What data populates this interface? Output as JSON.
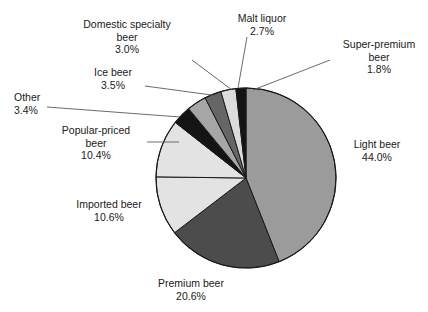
{
  "chart_data": {
    "type": "pie",
    "title": "",
    "subtitle": "",
    "xlabel": "",
    "ylabel": "",
    "legend": "none",
    "grid": false,
    "value_unit": "percent",
    "start_angle_deg": 0,
    "direction": "clockwise",
    "categories": [
      "Light beer",
      "Premium beer",
      "Imported beer",
      "Popular-priced beer",
      "Other",
      "Ice beer",
      "Domestic specialty beer",
      "Malt liquor",
      "Super-premium beer"
    ],
    "values": [
      44.0,
      20.6,
      10.6,
      10.4,
      3.4,
      3.5,
      3.0,
      2.7,
      1.8
    ],
    "slices": [
      {
        "label": "Light beer",
        "value": 44.0,
        "value_text": "44.0%",
        "color": "#9b9b9b"
      },
      {
        "label": "Premium beer",
        "value": 20.6,
        "value_text": "20.6%",
        "color": "#4c4c4c"
      },
      {
        "label": "Imported beer",
        "value": 10.6,
        "value_text": "10.6%",
        "color": "#e3e3e3"
      },
      {
        "label": "Popular-priced beer",
        "value": 10.4,
        "value_text": "10.4%",
        "color": "#e3e3e3"
      },
      {
        "label": "Other",
        "value": 3.4,
        "value_text": "3.4%",
        "color": "#141414"
      },
      {
        "label": "Ice beer",
        "value": 3.5,
        "value_text": "3.5%",
        "color": "#a6a6a6"
      },
      {
        "label": "Domestic specialty beer",
        "value": 3.0,
        "value_text": "3.0%",
        "color": "#666666"
      },
      {
        "label": "Malt liquor",
        "value": 2.7,
        "value_text": "2.7%",
        "color": "#dcdcdc"
      },
      {
        "label": "Super-premium beer",
        "value": 1.8,
        "value_text": "1.8%",
        "color": "#141414"
      }
    ]
  },
  "labels": {
    "light_beer": {
      "line1": "Light beer",
      "line2": "44.0%"
    },
    "premium_beer": {
      "line1": "Premium beer",
      "line2": "20.6%"
    },
    "imported_beer": {
      "line1": "Imported beer",
      "line2": "10.6%"
    },
    "popular_priced": {
      "line1": "Popular-priced",
      "line2": "beer",
      "line3": "10.4%"
    },
    "other": {
      "line1": "Other",
      "line2": "3.4%"
    },
    "ice_beer": {
      "line1": "Ice beer",
      "line2": "3.5%"
    },
    "domestic_specialty": {
      "line1": "Domestic specialty",
      "line2": "beer",
      "line3": "3.0%"
    },
    "malt_liquor": {
      "line1": "Malt liquor",
      "line2": "2.7%"
    },
    "super_premium": {
      "line1": "Super-premium",
      "line2": "beer",
      "line3": "1.8%"
    }
  },
  "style": {
    "outline_color": "#1a1a1a",
    "leader_color": "#5a5a5a",
    "background": "#ffffff"
  }
}
